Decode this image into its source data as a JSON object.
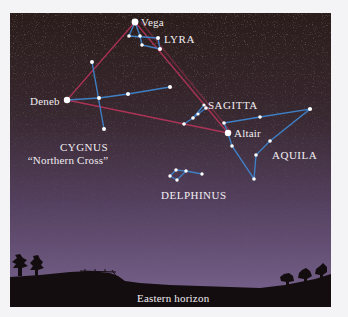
{
  "figure": {
    "sky_gradient": [
      "#2b1d1b",
      "#3a2a2f",
      "#5e4a6f",
      "#7a6490"
    ],
    "ground_color": "#140d10",
    "triangle_line_color": "#b8345a",
    "constellation_line_color": "#3f7fc4",
    "star_color": "#ffffff"
  },
  "labels": {
    "vega": "Vega",
    "lyra": "LYRA",
    "deneb": "Deneb",
    "sagitta": "SAGITTA",
    "altair": "Altair",
    "cygnus": "CYGNUS",
    "cygnus_sub": "“Northern Cross”",
    "aquila": "AQUILA",
    "delphinus": "DELPHINUS",
    "horizon": "Eastern horizon"
  },
  "stars": {
    "vega": [
      135,
      22
    ],
    "deneb": [
      67,
      100
    ],
    "altair": [
      228,
      133
    ]
  }
}
